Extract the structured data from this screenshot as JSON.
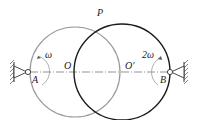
{
  "diagram": {
    "type": "mechanism",
    "labels": {
      "P": "P",
      "O": "O",
      "O_prime": "O′",
      "A": "A",
      "B": "B",
      "omega_A": "ω",
      "omega_B": "2ω"
    },
    "colors": {
      "circle_O": "#9a9a9a",
      "circle_O_prime": "#1a1a1a",
      "centerline": "#555555",
      "support": "#333333"
    }
  }
}
